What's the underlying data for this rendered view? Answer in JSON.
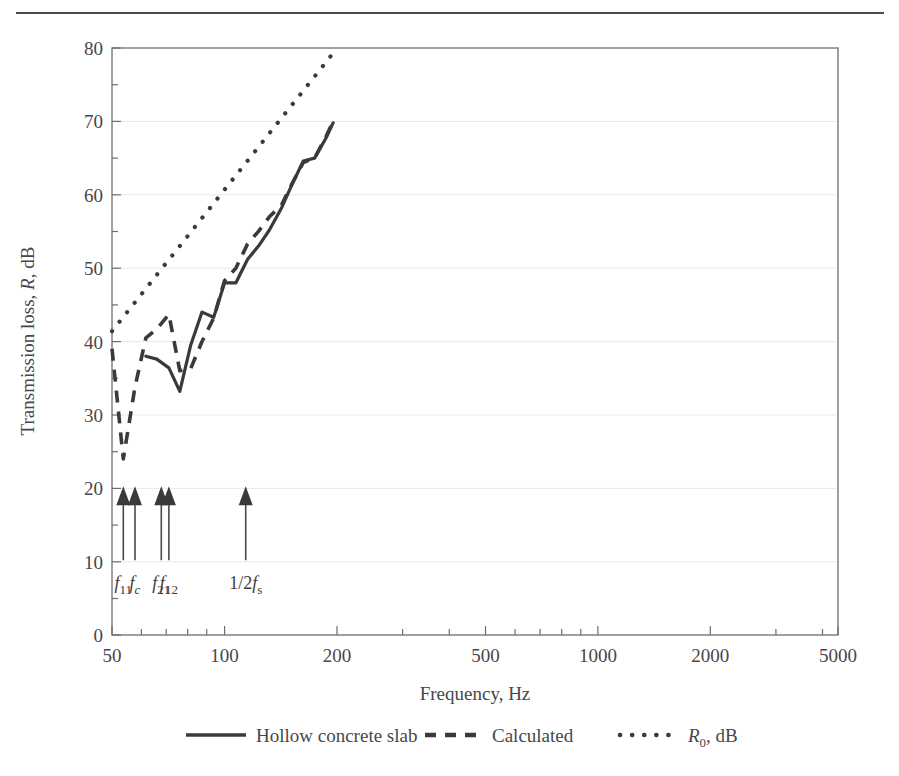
{
  "figure": {
    "has_top_rule": true,
    "background": "#ffffff",
    "ink_color": "#3a3a3d"
  },
  "chart_data": {
    "type": "line",
    "title": "",
    "xlabel": "Frequency, Hz",
    "ylabel": "Transmission loss, R, dB",
    "xscale": "log",
    "xlim": [
      45,
      5300
    ],
    "ylim": [
      0,
      80
    ],
    "xticks": [
      50,
      100,
      200,
      500,
      1000,
      2000,
      5000
    ],
    "xtick_labels": [
      "50",
      "100",
      "200",
      "500",
      "1000",
      "2000",
      "5000"
    ],
    "yticks": [
      0,
      10,
      20,
      30,
      40,
      50,
      60,
      70,
      80
    ],
    "ytick_labels": [
      "0",
      "10",
      "20",
      "30",
      "40",
      "50",
      "60",
      "70",
      "80"
    ],
    "grid": "horizontal-faint",
    "legend_position": "below-axes",
    "series": [
      {
        "name": "Hollow concrete slab",
        "style": "solid",
        "x": [
          100,
          125,
          160,
          200,
          250,
          315,
          400,
          500,
          630,
          800,
          1000,
          1250,
          1600,
          2000,
          2500,
          3150,
          4000,
          4600
        ],
        "y": [
          38.0,
          37.6,
          36.4,
          33.2,
          39.5,
          44.0,
          43.3,
          48.0,
          48.0,
          51.2,
          53.0,
          55.2,
          58.2,
          61.5,
          64.6,
          65.0,
          67.8,
          69.8
        ]
      },
      {
        "name": "Calculated",
        "style": "dashed",
        "x": [
          50,
          63,
          80,
          100,
          125,
          160,
          200,
          250,
          315,
          400,
          500,
          630,
          800,
          1000,
          1250,
          1600,
          2000,
          2500,
          3150,
          4000,
          4600
        ],
        "y": [
          39.0,
          24.0,
          33.8,
          40.5,
          41.7,
          43.7,
          36.0,
          36.3,
          40.0,
          43.2,
          48.3,
          50.0,
          53.3,
          55.0,
          57.0,
          58.6,
          61.6,
          64.4,
          65.0,
          68.0,
          70.0
        ]
      },
      {
        "name": "R0, dB",
        "style": "dotted",
        "x": [
          50,
          5000
        ],
        "y": [
          41.4,
          80.0
        ]
      }
    ],
    "annotations": [
      {
        "id": "f11",
        "freq": 63,
        "label_html": "f11",
        "label_base": "f",
        "label_sub": "11",
        "y_dB": 20,
        "arrow": "up"
      },
      {
        "id": "fc",
        "freq": 80,
        "label_base": "f",
        "label_sub": "c",
        "y_dB": 20,
        "arrow": "up"
      },
      {
        "id": "f21",
        "freq": 137,
        "label_base": "f",
        "label_sub": "21",
        "y_dB": 20,
        "arrow": "up"
      },
      {
        "id": "f12",
        "freq": 160,
        "label_base": "f",
        "label_sub": "12",
        "y_dB": 20,
        "arrow": "up"
      },
      {
        "id": "half-fs",
        "freq": 770,
        "label_prefix": "1/2",
        "label_base": "f",
        "label_sub": "s",
        "y_dB": 20,
        "arrow": "up"
      }
    ]
  },
  "legend": {
    "items": [
      {
        "label": "Hollow concrete slab",
        "style": "solid"
      },
      {
        "label": "Calculated",
        "style": "dashed"
      },
      {
        "label": "R",
        "sub": "0",
        "suffix": ", dB",
        "style": "dotted"
      }
    ]
  },
  "axis_text": {
    "ylabel_main": "Transmission loss, ",
    "ylabel_italic": "R",
    "ylabel_tail": ", dB",
    "xlabel": "Frequency, Hz"
  }
}
